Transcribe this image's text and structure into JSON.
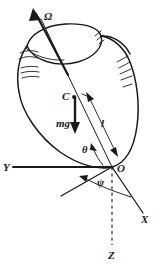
{
  "labels": {
    "omega": "Ω",
    "center_of_mass": "C",
    "weight": "mg",
    "length": "l",
    "origin": "O",
    "theta": "θ",
    "psi": "ψ",
    "axis_x": "X",
    "axis_y": "Y",
    "axis_z": "Z"
  },
  "colors": {
    "ink": "#1a1a1a",
    "background": "#ffffff"
  },
  "geometry": {
    "origin_point": [
      112,
      167
    ],
    "center_of_mass_point": [
      74,
      97
    ],
    "spin_axis_tip": [
      38,
      16
    ],
    "axis_y_end": [
      12,
      167
    ],
    "axis_x_end": [
      140,
      217
    ],
    "axis_z_end": [
      112,
      248
    ],
    "node_line_end": [
      62,
      197
    ],
    "theta_deg": 30,
    "psi_deg": 52
  },
  "elements": {
    "omega_arrow": "angular-velocity-vector",
    "mg_arrow": "weight-vector",
    "l_arrow": "distance-double-arrow",
    "z_axis_style": "dashed",
    "spin_axis_style": "thin-solid-through-body"
  }
}
